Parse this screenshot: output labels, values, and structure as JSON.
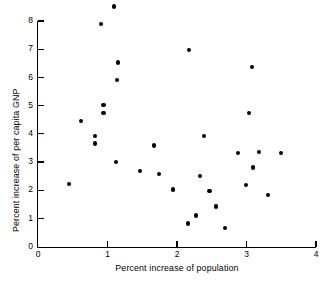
{
  "chart_data": {
    "type": "scatter",
    "title": "",
    "xlabel": "Percent increase of population",
    "ylabel": "Percent increase of per capita GNP",
    "xlim": [
      0,
      4
    ],
    "ylim": [
      0,
      8
    ],
    "xticks": [
      0,
      1,
      2,
      3,
      4
    ],
    "yticks": [
      0,
      1,
      2,
      3,
      4,
      5,
      6,
      7,
      8
    ],
    "xtick_labels": [
      "0",
      "1",
      "2",
      "3",
      "4"
    ],
    "ytick_labels": [
      "0",
      "1",
      "2",
      "3",
      "4",
      "5",
      "6",
      "7",
      "8"
    ],
    "grid": false,
    "legend": null,
    "marker": "filled-circle",
    "marker_color": "#000000",
    "points": [
      {
        "x": 1.09,
        "y": 8.52
      },
      {
        "x": 0.91,
        "y": 7.89
      },
      {
        "x": 1.15,
        "y": 6.53
      },
      {
        "x": 1.14,
        "y": 5.9
      },
      {
        "x": 2.17,
        "y": 6.97
      },
      {
        "x": 3.08,
        "y": 6.37
      },
      {
        "x": 3.04,
        "y": 4.74
      },
      {
        "x": 0.94,
        "y": 5.03
      },
      {
        "x": 0.94,
        "y": 4.74
      },
      {
        "x": 0.62,
        "y": 4.46
      },
      {
        "x": 0.82,
        "y": 3.93
      },
      {
        "x": 0.82,
        "y": 3.65
      },
      {
        "x": 1.12,
        "y": 3.01
      },
      {
        "x": 1.47,
        "y": 2.69
      },
      {
        "x": 0.45,
        "y": 2.23
      },
      {
        "x": 2.39,
        "y": 3.93
      },
      {
        "x": 1.67,
        "y": 3.58
      },
      {
        "x": 1.74,
        "y": 2.58
      },
      {
        "x": 2.33,
        "y": 2.51
      },
      {
        "x": 1.94,
        "y": 2.02
      },
      {
        "x": 2.88,
        "y": 3.33
      },
      {
        "x": 3.18,
        "y": 3.36
      },
      {
        "x": 3.5,
        "y": 3.33
      },
      {
        "x": 3.09,
        "y": 2.8
      },
      {
        "x": 2.99,
        "y": 2.19
      },
      {
        "x": 3.31,
        "y": 1.84
      },
      {
        "x": 2.47,
        "y": 1.97
      },
      {
        "x": 2.56,
        "y": 1.42
      },
      {
        "x": 2.27,
        "y": 1.1
      },
      {
        "x": 2.69,
        "y": 0.67
      },
      {
        "x": 2.16,
        "y": 0.82
      }
    ]
  }
}
